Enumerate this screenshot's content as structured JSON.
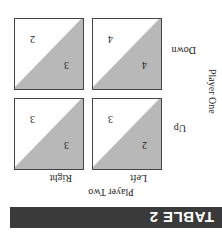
{
  "title": "TABLE 2",
  "player_two": "Player Two",
  "player_one": "Player One",
  "columns": [
    "Left",
    "Right"
  ],
  "rows": [
    "Up",
    "Down"
  ],
  "cells": [
    {
      "row": "Up",
      "col": "Left",
      "p1": "2",
      "p2": "3"
    },
    {
      "row": "Up",
      "col": "Right",
      "p1": "3",
      "p2": "3"
    },
    {
      "row": "Down",
      "col": "Left",
      "p1": "4",
      "p2": "4"
    },
    {
      "row": "Down",
      "col": "Right",
      "p1": "3",
      "p2": "2"
    }
  ],
  "colors": {
    "header": "#3a3a3a",
    "shade": "#b8b8b8"
  }
}
